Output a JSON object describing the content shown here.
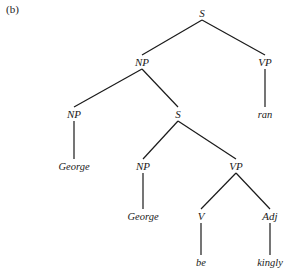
{
  "figure_label": "(b)",
  "tree": {
    "nodes": [
      {
        "id": "s0",
        "label": "S",
        "x": 202,
        "y": 17
      },
      {
        "id": "np1",
        "label": "NP",
        "x": 142,
        "y": 66
      },
      {
        "id": "vp1",
        "label": "VP",
        "x": 265,
        "y": 66
      },
      {
        "id": "np2",
        "label": "NP",
        "x": 74,
        "y": 118
      },
      {
        "id": "s2",
        "label": "S",
        "x": 178,
        "y": 118
      },
      {
        "id": "ran",
        "label": "ran",
        "x": 265,
        "y": 118
      },
      {
        "id": "g1",
        "label": "George",
        "x": 74,
        "y": 170
      },
      {
        "id": "np3",
        "label": "NP",
        "x": 143,
        "y": 170
      },
      {
        "id": "vp3",
        "label": "VP",
        "x": 236,
        "y": 170
      },
      {
        "id": "g2",
        "label": "George",
        "x": 143,
        "y": 220
      },
      {
        "id": "v",
        "label": "V",
        "x": 201,
        "y": 220
      },
      {
        "id": "adj",
        "label": "Adj",
        "x": 270,
        "y": 220
      },
      {
        "id": "be",
        "label": "be",
        "x": 201,
        "y": 266
      },
      {
        "id": "kingly",
        "label": "kingly",
        "x": 270,
        "y": 266
      }
    ],
    "edges": [
      [
        "s0",
        "np1"
      ],
      [
        "s0",
        "vp1"
      ],
      [
        "np1",
        "np2"
      ],
      [
        "np1",
        "s2"
      ],
      [
        "vp1",
        "ran"
      ],
      [
        "np2",
        "g1"
      ],
      [
        "s2",
        "np3"
      ],
      [
        "s2",
        "vp3"
      ],
      [
        "np3",
        "g2"
      ],
      [
        "vp3",
        "v"
      ],
      [
        "vp3",
        "adj"
      ],
      [
        "v",
        "be"
      ],
      [
        "adj",
        "kingly"
      ]
    ]
  }
}
